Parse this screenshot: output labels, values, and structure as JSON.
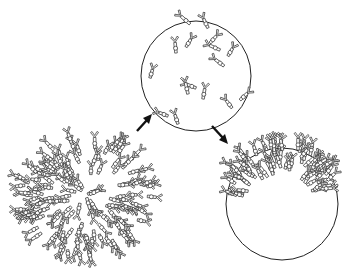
{
  "figure": {
    "panels": [
      {
        "id": "dense",
        "label": "",
        "cx": 85,
        "cy": 195,
        "r": 68,
        "spike_density": "high",
        "coverage": "full"
      },
      {
        "id": "sparse",
        "label": "",
        "cx": 196,
        "cy": 76,
        "r": 55,
        "spike_density": "low",
        "coverage": "scattered"
      },
      {
        "id": "capped",
        "label": "",
        "cx": 282,
        "cy": 204,
        "r": 56,
        "spike_density": "high",
        "coverage": "upper-left cap"
      }
    ],
    "arrows": [
      {
        "from": "dense",
        "to": "sparse",
        "x1": 137,
        "y1": 131,
        "x2": 150,
        "y2": 117
      },
      {
        "from": "sparse",
        "to": "capped",
        "x1": 212,
        "y1": 126,
        "x2": 227,
        "y2": 142
      }
    ],
    "colors": {
      "line": "#222222",
      "background": "#ffffff"
    }
  }
}
